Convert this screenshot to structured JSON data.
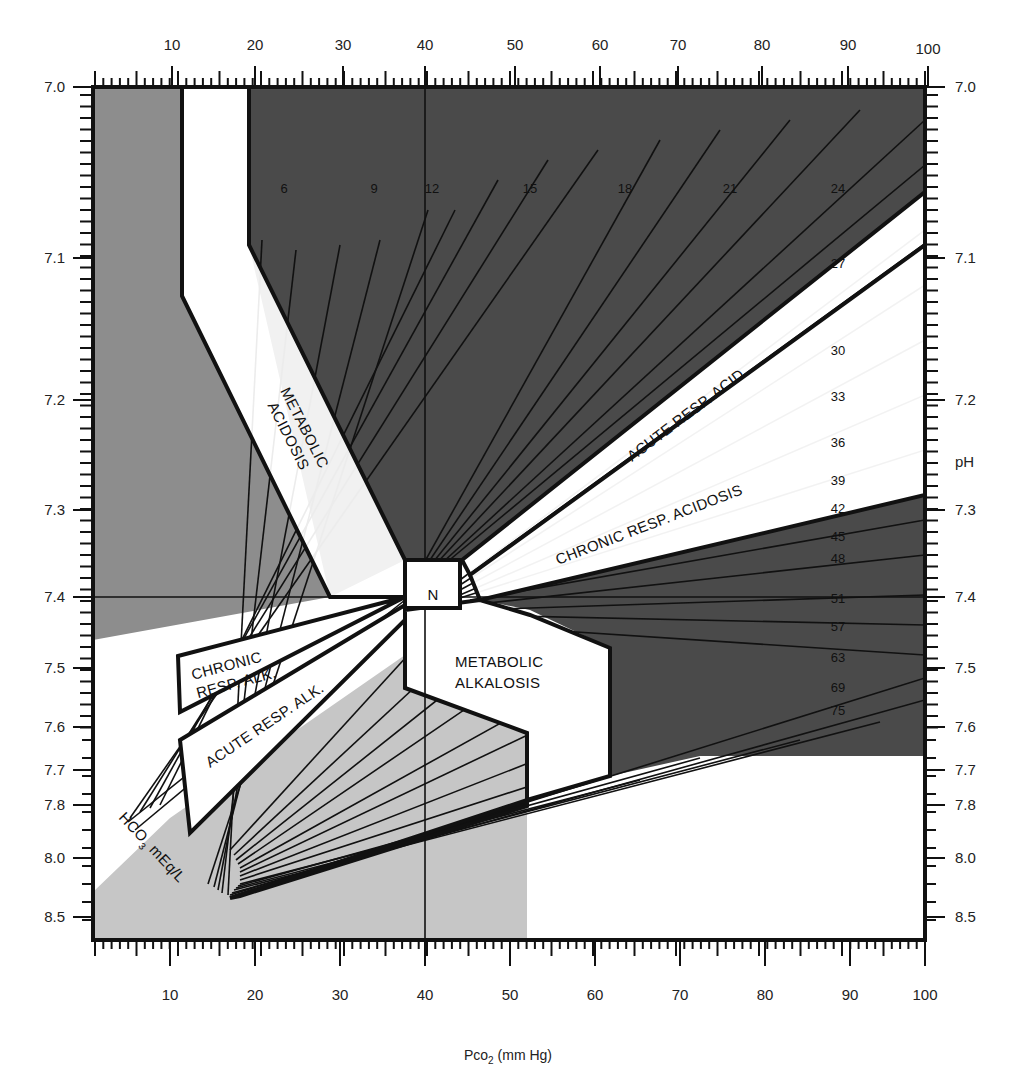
{
  "chart_data": {
    "type": "diagram-nomogram",
    "xlabel": "PCO2 (mm Hg)",
    "xlabel_main": "Pco",
    "xlabel_sub": "2",
    "xlabel_unit": " (mm Hg)",
    "ylabel": "pH",
    "xlim": [
      0,
      100
    ],
    "ylim_ph": [
      7.0,
      8.5
    ],
    "x_ticks": [
      "10",
      "20",
      "30",
      "40",
      "50",
      "60",
      "70",
      "80",
      "90",
      "100"
    ],
    "x_tick_px_top": [
      172,
      255,
      343,
      425,
      515,
      600,
      678,
      762,
      848,
      928
    ],
    "x_tick_px_bottom": [
      170,
      255,
      340,
      425,
      510,
      595,
      680,
      765,
      850,
      925
    ],
    "y_ticks": [
      "7.0",
      "7.1",
      "7.2",
      "7.3",
      "7.4",
      "7.5",
      "7.6",
      "7.7",
      "7.8",
      "8.0",
      "8.5"
    ],
    "y_tick_px": [
      87,
      258,
      400,
      510,
      597,
      668,
      727,
      770,
      805,
      858,
      917
    ],
    "right_axis_extra_label": "pH",
    "right_axis_extra_label_px": 462,
    "isopleth_label_title_main": "HCO",
    "isopleth_label_title_sub": "3",
    "isopleth_label_title_unit": " mEq/L",
    "isopleths_hco3_mEq_per_L": [
      "6",
      "9",
      "12",
      "15",
      "18",
      "21",
      "24",
      "27",
      "30",
      "33",
      "36",
      "39",
      "42",
      "45",
      "48",
      "51",
      "57",
      "63",
      "69",
      "75"
    ],
    "isopleth_label_positions": [
      {
        "label": "6",
        "x": 284,
        "y": 190
      },
      {
        "label": "9",
        "x": 374,
        "y": 190
      },
      {
        "label": "12",
        "x": 432,
        "y": 190
      },
      {
        "label": "15",
        "x": 530,
        "y": 190
      },
      {
        "label": "18",
        "x": 625,
        "y": 190
      },
      {
        "label": "21",
        "x": 730,
        "y": 190
      },
      {
        "label": "24",
        "x": 838,
        "y": 190
      },
      {
        "label": "27",
        "x": 838,
        "y": 265
      },
      {
        "label": "30",
        "x": 838,
        "y": 352
      },
      {
        "label": "33",
        "x": 838,
        "y": 398
      },
      {
        "label": "36",
        "x": 838,
        "y": 444
      },
      {
        "label": "39",
        "x": 838,
        "y": 482
      },
      {
        "label": "42",
        "x": 838,
        "y": 510
      },
      {
        "label": "45",
        "x": 838,
        "y": 538
      },
      {
        "label": "48",
        "x": 838,
        "y": 560
      },
      {
        "label": "51",
        "x": 838,
        "y": 600
      },
      {
        "label": "57",
        "x": 838,
        "y": 628
      },
      {
        "label": "63",
        "x": 838,
        "y": 659
      },
      {
        "label": "69",
        "x": 838,
        "y": 689
      },
      {
        "label": "75",
        "x": 838,
        "y": 712
      }
    ],
    "regions": [
      {
        "name": "Normal",
        "label": "N"
      },
      {
        "name": "Metabolic acidosis",
        "label_lines": [
          "METABOLIC",
          "ACIDOSIS"
        ]
      },
      {
        "name": "Metabolic alkalosis",
        "label_lines": [
          "METABOLIC",
          "ALKALOSIS"
        ]
      },
      {
        "name": "Acute respiratory acidosis",
        "label_lines": [
          "ACUTE RESP. ACID"
        ]
      },
      {
        "name": "Chronic respiratory acidosis",
        "label_lines": [
          "CHRONIC RESP. ACIDOSIS"
        ]
      },
      {
        "name": "Acute respiratory alkalosis",
        "label_lines": [
          "ACUTE RESP. ALK."
        ]
      },
      {
        "name": "Chronic respiratory alkalosis",
        "label_lines": [
          "CHRONIC",
          "RESP. ALK."
        ]
      }
    ],
    "reference_lines": {
      "pco2": 40,
      "ph": 7.4
    },
    "grid": false,
    "legend": null
  },
  "colors": {
    "dark_shade": "#4a4a4a",
    "mid_shade": "#8d8d8d",
    "light_shade": "#c6c6c6",
    "white": "#ffffff",
    "ink": "#111111"
  }
}
